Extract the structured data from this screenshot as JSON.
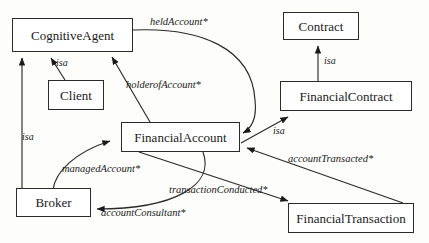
{
  "diagram": {
    "type": "uml-class-relationship-diagram",
    "width": 429,
    "height": 243,
    "background_color": "#fdfdfb",
    "stroke_color": "#2a2a2a",
    "text_color": "#1a1a1a",
    "nodes": [
      {
        "id": "cognitive-agent",
        "label": "CognitiveAgent",
        "x": 12,
        "y": 18,
        "w": 121,
        "h": 34
      },
      {
        "id": "client",
        "label": "Client",
        "x": 48,
        "y": 80,
        "w": 56,
        "h": 30
      },
      {
        "id": "broker",
        "label": "Broker",
        "x": 16,
        "y": 188,
        "w": 75,
        "h": 29
      },
      {
        "id": "financial-account",
        "label": "FinancialAccount",
        "x": 121,
        "y": 122,
        "w": 119,
        "h": 30
      },
      {
        "id": "contract",
        "label": "Contract",
        "x": 283,
        "y": 12,
        "w": 76,
        "h": 28
      },
      {
        "id": "financial-contract",
        "label": "FinancialContract",
        "x": 280,
        "y": 81,
        "w": 132,
        "h": 30
      },
      {
        "id": "financial-transaction",
        "label": "FinancialTransaction",
        "x": 288,
        "y": 203,
        "w": 126,
        "h": 30
      }
    ],
    "edges": [
      {
        "id": "held-account",
        "label": "heldAccount*",
        "from": "cognitive-agent",
        "to": "financial-account",
        "label_x": 150,
        "label_y": 16
      },
      {
        "id": "holder-of-account",
        "label": "holderofAccount*",
        "from": "financial-account",
        "to": "cognitive-agent",
        "label_x": 126,
        "label_y": 79
      },
      {
        "id": "isa-client",
        "label": "isa",
        "from": "client",
        "to": "cognitive-agent",
        "label_x": 56,
        "label_y": 57
      },
      {
        "id": "isa-broker",
        "label": "isa",
        "from": "broker",
        "to": "cognitive-agent",
        "label_x": 22,
        "label_y": 131
      },
      {
        "id": "isa-contract",
        "label": "isa",
        "from": "financial-contract",
        "to": "contract",
        "label_x": 324,
        "label_y": 55
      },
      {
        "id": "isa-account",
        "label": "isa",
        "from": "financial-account",
        "to": "financial-contract",
        "label_x": 273,
        "label_y": 125
      },
      {
        "id": "managed-account",
        "label": "managedAccount*",
        "from": "broker",
        "to": "financial-account",
        "label_x": 62,
        "label_y": 163
      },
      {
        "id": "account-consultant",
        "label": "accountConsultant*",
        "from": "financial-account",
        "to": "broker",
        "label_x": 101,
        "label_y": 207
      },
      {
        "id": "transaction-conducted",
        "label": "transactionConducted*",
        "from": "financial-account",
        "to": "financial-transaction",
        "label_x": 169,
        "label_y": 184
      },
      {
        "id": "account-transacted",
        "label": "accountTransacted*",
        "from": "financial-transaction",
        "to": "financial-account",
        "label_x": 288,
        "label_y": 153
      }
    ]
  }
}
